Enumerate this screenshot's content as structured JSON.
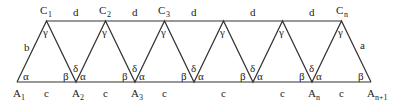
{
  "diagram": {
    "type": "triangle-strip",
    "colors": {
      "line": "#333333",
      "text": "#222222",
      "background": "#ffffff"
    },
    "top_vertices": [
      {
        "label": "C",
        "sub": "1"
      },
      {
        "label": "C",
        "sub": "2"
      },
      {
        "label": "C",
        "sub": "3"
      },
      {
        "label": "",
        "sub": ""
      },
      {
        "label": "",
        "sub": ""
      },
      {
        "label": "C",
        "sub": "n"
      }
    ],
    "bottom_vertices": [
      {
        "label": "A",
        "sub": "1"
      },
      {
        "label": "A",
        "sub": "2"
      },
      {
        "label": "A",
        "sub": "3"
      },
      {
        "label": "",
        "sub": ""
      },
      {
        "label": "",
        "sub": ""
      },
      {
        "label": "A",
        "sub": "n"
      },
      {
        "label": "A",
        "sub": "n+1"
      }
    ],
    "top_segment_label": "d",
    "bottom_segment_label": "c",
    "left_side_label": "b",
    "right_side_label": "a",
    "angles": {
      "alpha": "α",
      "beta": "β",
      "gamma": "γ",
      "delta": "δ"
    }
  }
}
